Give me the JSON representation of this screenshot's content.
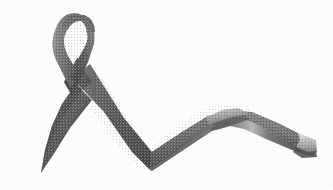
{
  "image": {
    "subject": "awareness-ribbon",
    "caption": "Grey looped awareness ribbon with long trailing wave",
    "alt_text": "A grey satin awareness ribbon folded into a loop at the upper left, crossing into an X, with one short tail pointing down to the lower left and a long tail waving across to the right edge",
    "width": 333,
    "height": 190,
    "medium": "scanned halftone grayscale photograph",
    "background_color": "#ffffff"
  },
  "palette": {
    "background": "#ffffff",
    "ribbon_dark": "#4f4f4f",
    "ribbon_mid": "#6d6d6d",
    "ribbon_light": "#8f8f8f",
    "ribbon_highlight": "#c9c9c9",
    "ribbon_shadow": "#3d3d3d",
    "loop_hole": "#ffffff",
    "edge_tone": "#585858"
  },
  "parts": {
    "loop": "ribbon-loop",
    "loop_hole": "loop-inner-hole",
    "crossing": "ribbon-crossing-x",
    "left_tail": "left-tail",
    "right_tail": "right-tail",
    "valley": "bottom-valley",
    "crest": "right-crest-twist",
    "end_fold": "right-end-fold"
  },
  "geometry": {
    "loop_top_y": 14,
    "loop_hole_bounds": [
      62,
      30,
      88,
      58
    ],
    "crossing_center": [
      82,
      84
    ],
    "left_tail_tip": [
      40,
      172
    ],
    "valley_bottom": [
      150,
      168
    ],
    "crest_peak": [
      230,
      116
    ],
    "right_end_x": 316,
    "right_end_y": 150
  }
}
